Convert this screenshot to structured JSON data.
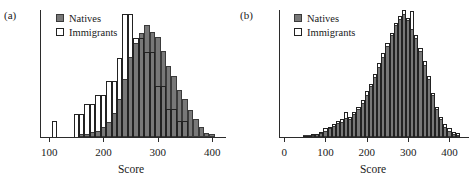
{
  "figure": {
    "panels": [
      {
        "label": "(a)",
        "name": "panel-a",
        "axis": {
          "xlabel": "Score",
          "xticks": [
            100,
            200,
            300,
            400
          ],
          "xlim": [
            85,
            420
          ],
          "ylim_max": 1.0,
          "grid": false
        },
        "legend": {
          "position": "top-left",
          "entries": [
            {
              "label": "Natives",
              "swatch": "filled-gray-square",
              "color": "#787878"
            },
            {
              "label": "Immigrants",
              "swatch": "open-white-square",
              "color": "#ffffff"
            }
          ]
        }
      },
      {
        "label": "(b)",
        "name": "panel-b",
        "axis": {
          "xlabel": "Score",
          "xticks": [
            0,
            100,
            200,
            300,
            400
          ],
          "xlim": [
            -10,
            440
          ],
          "ylim_max": 1.0,
          "grid": false
        },
        "legend": {
          "position": "top-left",
          "entries": [
            {
              "label": "Natives",
              "swatch": "filled-gray-square",
              "color": "#787878"
            },
            {
              "label": "Immigrants",
              "swatch": "open-white-square",
              "color": "#ffffff"
            }
          ]
        }
      }
    ]
  },
  "chart_data": [
    {
      "type": "bar",
      "subplot": "(a)",
      "title": "",
      "xlabel": "Score",
      "ylabel": "",
      "xlim": [
        85,
        420
      ],
      "ylim": [
        0,
        1.0
      ],
      "grid": false,
      "legend_position": "top-left",
      "bin_width": 10,
      "x": [
        110,
        120,
        130,
        140,
        150,
        160,
        170,
        180,
        190,
        200,
        210,
        220,
        230,
        240,
        250,
        260,
        270,
        280,
        290,
        300,
        310,
        320,
        330,
        340,
        350,
        360,
        370,
        380,
        390,
        400
      ],
      "series": [
        {
          "name": "Natives",
          "style": "filled-gray",
          "values": [
            0.0,
            0.0,
            0.0,
            0.0,
            0.0,
            0.02,
            0.02,
            0.04,
            0.05,
            0.08,
            0.12,
            0.19,
            0.3,
            0.46,
            0.63,
            0.74,
            0.82,
            0.88,
            0.83,
            0.79,
            0.68,
            0.56,
            0.48,
            0.37,
            0.3,
            0.21,
            0.14,
            0.08,
            0.03,
            0.02
          ]
        },
        {
          "name": "Immigrants",
          "style": "open-outline",
          "values": [
            0.13,
            0.0,
            0.0,
            0.0,
            0.18,
            0.18,
            0.26,
            0.26,
            0.33,
            0.33,
            0.44,
            0.44,
            0.62,
            0.97,
            0.97,
            0.78,
            0.78,
            0.67,
            0.67,
            0.4,
            0.4,
            0.22,
            0.22,
            0.13,
            0.13,
            0.0,
            0.0,
            0.0,
            0.0,
            0.0
          ]
        }
      ]
    },
    {
      "type": "bar",
      "subplot": "(b)",
      "title": "",
      "xlabel": "Score",
      "ylabel": "",
      "xlim": [
        -10,
        440
      ],
      "ylim": [
        0,
        1.0
      ],
      "grid": false,
      "legend_position": "top-left",
      "bin_width": 10,
      "x": [
        50,
        60,
        70,
        80,
        90,
        100,
        110,
        120,
        130,
        140,
        150,
        160,
        170,
        180,
        190,
        200,
        210,
        220,
        230,
        240,
        250,
        260,
        270,
        280,
        290,
        300,
        310,
        320,
        330,
        340,
        350,
        360,
        370,
        380,
        390,
        400,
        410,
        420
      ],
      "series": [
        {
          "name": "Natives",
          "style": "filled-gray",
          "values": [
            0.01,
            0.01,
            0.01,
            0.02,
            0.03,
            0.05,
            0.07,
            0.09,
            0.11,
            0.12,
            0.15,
            0.14,
            0.18,
            0.22,
            0.27,
            0.33,
            0.4,
            0.47,
            0.55,
            0.63,
            0.72,
            0.8,
            0.88,
            0.93,
            0.97,
            0.92,
            0.85,
            0.78,
            0.68,
            0.57,
            0.46,
            0.33,
            0.22,
            0.14,
            0.08,
            0.05,
            0.02,
            0.01
          ]
        },
        {
          "name": "Immigrants",
          "style": "open-outline",
          "values": [
            0.01,
            0.01,
            0.02,
            0.02,
            0.04,
            0.07,
            0.08,
            0.1,
            0.13,
            0.14,
            0.2,
            0.16,
            0.2,
            0.24,
            0.29,
            0.36,
            0.42,
            0.5,
            0.58,
            0.66,
            0.74,
            0.82,
            0.9,
            0.95,
            1.0,
            0.94,
            0.99,
            0.8,
            0.7,
            0.6,
            0.48,
            0.35,
            0.24,
            0.16,
            0.1,
            0.07,
            0.04,
            0.03
          ]
        }
      ]
    }
  ]
}
